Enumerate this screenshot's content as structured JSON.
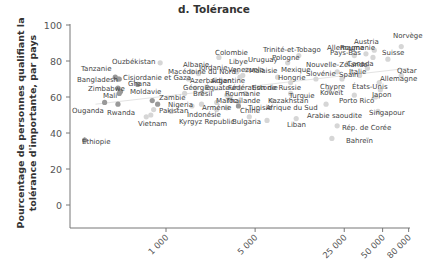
{
  "chart_data": {
    "type": "scatter",
    "title": "d. Tolérance",
    "xlabel": "",
    "ylabel": "Pourcentage de personnes qualifiant la tolérance d'importante, par pays",
    "xscale": "log",
    "xlim": [
      200,
      80000
    ],
    "ylim": [
      -13,
      100
    ],
    "x_ticks": [
      1000,
      5000,
      25000,
      50000,
      80000
    ],
    "x_tick_labels": [
      "1 000",
      "5 000",
      "25 000",
      "50 000",
      "80 000"
    ],
    "y_ticks": [
      0,
      20,
      40,
      60,
      80,
      100
    ],
    "y_tick_labels": [
      "0",
      "20",
      "40",
      "60",
      "80",
      "100"
    ],
    "grid": false,
    "legend": null,
    "trend_line": {
      "x": [
        280,
        80000
      ],
      "y": [
        56,
        76
      ]
    },
    "colors": {
      "low_income": "#999999",
      "high_income": "#d6d6d6",
      "text": "#444444"
    },
    "points": [
      {
        "label": "Tanzanie",
        "x": 400,
        "y": 71,
        "group": "low"
      },
      {
        "label": "Bangladesh",
        "x": 420,
        "y": 70,
        "group": "low"
      },
      {
        "label": "Ouzbékistan",
        "x": 900,
        "y": 79,
        "group": "high"
      },
      {
        "label": "Cisjordanie et Gaza",
        "x": 430,
        "y": 70,
        "group": "low"
      },
      {
        "label": "Ghana",
        "x": 600,
        "y": 67,
        "group": "low"
      },
      {
        "label": "Zimbabwe",
        "x": 420,
        "y": 65,
        "group": "low"
      },
      {
        "label": "Moldavie",
        "x": 440,
        "y": 63,
        "group": "low"
      },
      {
        "label": "Mali",
        "x": 430,
        "y": 62,
        "group": "low"
      },
      {
        "label": "Ouganda",
        "x": 330,
        "y": 57,
        "group": "low"
      },
      {
        "label": "Rwanda",
        "x": 420,
        "y": 56,
        "group": "low"
      },
      {
        "label": "Zambie",
        "x": 780,
        "y": 58,
        "group": "low"
      },
      {
        "label": "Nigeria",
        "x": 860,
        "y": 56,
        "group": "low"
      },
      {
        "label": "Pakistan",
        "x": 800,
        "y": 53,
        "group": "high"
      },
      {
        "label": "Vietnam",
        "x": 760,
        "y": 50,
        "group": "high"
      },
      {
        "label": "Indonésie",
        "x": 1100,
        "y": 52,
        "group": "high"
      },
      {
        "label": "Éthiopie",
        "x": 230,
        "y": 36,
        "group": "low"
      },
      {
        "label": "Albanie",
        "x": 1600,
        "y": 74,
        "group": "high"
      },
      {
        "label": "Macédoine du Nord",
        "x": 1500,
        "y": 70,
        "group": "high"
      },
      {
        "label": "Jordanie",
        "x": 1800,
        "y": 73,
        "group": "high"
      },
      {
        "label": "Azerbaïdjan",
        "x": 1700,
        "y": 65,
        "group": "high"
      },
      {
        "label": "Géorgie",
        "x": 1400,
        "y": 62,
        "group": "high"
      },
      {
        "label": "Équateur",
        "x": 1900,
        "y": 62,
        "group": "high"
      },
      {
        "label": "Arménie",
        "x": 1600,
        "y": 55,
        "group": "high"
      },
      {
        "label": "Kyrgyz Republic",
        "x": 700,
        "y": 49,
        "group": "high"
      },
      {
        "label": "Colombie",
        "x": 2600,
        "y": 82,
        "group": "high"
      },
      {
        "label": "Libye",
        "x": 3600,
        "y": 74,
        "group": "high"
      },
      {
        "label": "Uruguay",
        "x": 4300,
        "y": 75,
        "group": "high"
      },
      {
        "label": "Malaisie",
        "x": 4000,
        "y": 72,
        "group": "high"
      },
      {
        "label": "Venezuela",
        "x": 3800,
        "y": 71,
        "group": "high"
      },
      {
        "label": "Argentine",
        "x": 3800,
        "y": 65,
        "group": "high"
      },
      {
        "label": "Fédération de Russie",
        "x": 4200,
        "y": 62,
        "group": "high"
      },
      {
        "label": "Roumanie",
        "x": 3200,
        "y": 60,
        "group": "high"
      },
      {
        "label": "Brésil",
        "x": 3000,
        "y": 61,
        "group": "high"
      },
      {
        "label": "Thaïlande",
        "x": 2500,
        "y": 57,
        "group": "high"
      },
      {
        "label": "Kazakhstan",
        "x": 3700,
        "y": 57,
        "group": "high"
      },
      {
        "label": "Maroc",
        "x": 1900,
        "y": 56,
        "group": "high"
      },
      {
        "label": "Tunisie",
        "x": 3000,
        "y": 54,
        "group": "high"
      },
      {
        "label": "Chine",
        "x": 2500,
        "y": 53,
        "group": "high"
      },
      {
        "label": "Afrique du Sud",
        "x": 3700,
        "y": 55,
        "group": "low"
      },
      {
        "label": "Bulgaria",
        "x": 4500,
        "y": 49,
        "group": "high"
      },
      {
        "label": "Trinité-et-Tobago",
        "x": 11000,
        "y": 83,
        "group": "high"
      },
      {
        "label": "Pologne",
        "x": 9000,
        "y": 79,
        "group": "high"
      },
      {
        "label": "Mexique",
        "x": 7500,
        "y": 71,
        "group": "high"
      },
      {
        "label": "Hongrie",
        "x": 9500,
        "y": 68,
        "group": "high"
      },
      {
        "label": "Estonie",
        "x": 9500,
        "y": 62,
        "group": "high"
      },
      {
        "label": "Turquie",
        "x": 6800,
        "y": 58,
        "group": "high"
      },
      {
        "label": "Liban",
        "x": 6200,
        "y": 47,
        "group": "high"
      },
      {
        "label": "Nouvelle-Zélande",
        "x": 22000,
        "y": 74,
        "group": "high"
      },
      {
        "label": "Slovénie",
        "x": 15000,
        "y": 70,
        "group": "high"
      },
      {
        "label": "Spain",
        "x": 24000,
        "y": 70,
        "group": "high"
      },
      {
        "label": "Chypre",
        "x": 19000,
        "y": 64,
        "group": "high"
      },
      {
        "label": "Koweït",
        "x": 30000,
        "y": 61,
        "group": "high"
      },
      {
        "label": "Porto Rico",
        "x": 18000,
        "y": 56,
        "group": "high"
      },
      {
        "label": "Arabie saoudite",
        "x": 10500,
        "y": 48,
        "group": "high"
      },
      {
        "label": "Rép. de Corée",
        "x": 22000,
        "y": 44,
        "group": "high"
      },
      {
        "label": "Bahreïn",
        "x": 20000,
        "y": 37,
        "group": "high"
      },
      {
        "label": "Allemagne",
        "x": 37000,
        "y": 84,
        "group": "high"
      },
      {
        "label": "Roumanie",
        "x": 30000,
        "y": 83,
        "group": "high"
      },
      {
        "label": "Pays-Bas",
        "x": 42000,
        "y": 82,
        "group": "high"
      },
      {
        "label": "Austria",
        "x": 43000,
        "y": 86,
        "group": "high"
      },
      {
        "label": "Suisse",
        "x": 55000,
        "y": 81,
        "group": "high"
      },
      {
        "label": "Norvège",
        "x": 70000,
        "y": 88,
        "group": "high"
      },
      {
        "label": "Canada",
        "x": 38000,
        "y": 76,
        "group": "high"
      },
      {
        "label": "Italie",
        "x": 33000,
        "y": 72,
        "group": "high"
      },
      {
        "label": "Qatar",
        "x": 70000,
        "y": 72,
        "group": "high"
      },
      {
        "label": "Allemagne",
        "x": 47000,
        "y": 68,
        "group": "high"
      },
      {
        "label": "États-Unis",
        "x": 48000,
        "y": 64,
        "group": "high"
      },
      {
        "label": "Japon",
        "x": 44000,
        "y": 60,
        "group": "high"
      },
      {
        "label": "Singapour",
        "x": 46000,
        "y": 52,
        "group": "high"
      }
    ],
    "labels_placed": [
      {
        "text": "Tanzanie",
        "x": 81,
        "y": 71
      },
      {
        "text": "Bangladesh",
        "x": 77,
        "y": 82
      },
      {
        "text": "Ouzbékistan",
        "x": 112,
        "y": 64
      },
      {
        "text": "Cisjordanie et Gaza",
        "x": 123,
        "y": 80
      },
      {
        "text": "Ghana",
        "x": 128,
        "y": 86
      },
      {
        "text": "Zimbabwe",
        "x": 88,
        "y": 91
      },
      {
        "text": "Moldavie",
        "x": 130,
        "y": 94
      },
      {
        "text": "Mali",
        "x": 103,
        "y": 98
      },
      {
        "text": "Ouganda",
        "x": 72,
        "y": 113
      },
      {
        "text": "Rwanda",
        "x": 107,
        "y": 115
      },
      {
        "text": "Zambie",
        "x": 159,
        "y": 100
      },
      {
        "text": "Nigeria",
        "x": 168,
        "y": 107
      },
      {
        "text": "Pakistan",
        "x": 159,
        "y": 113
      },
      {
        "text": "Vietnam",
        "x": 138,
        "y": 126
      },
      {
        "text": "Indonésie",
        "x": 187,
        "y": 117
      },
      {
        "text": "Éthiopie",
        "x": 82,
        "y": 144
      },
      {
        "text": "Albanie",
        "x": 183,
        "y": 67
      },
      {
        "text": "Jordanie",
        "x": 199,
        "y": 70
      },
      {
        "text": "Macédoine du Nord",
        "x": 168,
        "y": 74
      },
      {
        "text": "Azerbaïdjan",
        "x": 190,
        "y": 83
      },
      {
        "text": "Argentine",
        "x": 211,
        "y": 83
      },
      {
        "text": "Géorgie",
        "x": 183,
        "y": 90
      },
      {
        "text": "Équateur",
        "x": 205,
        "y": 90
      },
      {
        "text": "Fédération de Russie",
        "x": 228,
        "y": 90
      },
      {
        "text": "Roumanie",
        "x": 225,
        "y": 96
      },
      {
        "text": "Brésil",
        "x": 193,
        "y": 96
      },
      {
        "text": "Thaïlande",
        "x": 226,
        "y": 103
      },
      {
        "text": "Kazakhstan",
        "x": 268,
        "y": 103
      },
      {
        "text": "Maroc",
        "x": 216,
        "y": 103
      },
      {
        "text": "Arménie",
        "x": 202,
        "y": 110
      },
      {
        "text": "Tunisie",
        "x": 248,
        "y": 110
      },
      {
        "text": "Chine",
        "x": 240,
        "y": 113
      },
      {
        "text": "Afrique du Sud",
        "x": 266,
        "y": 110
      },
      {
        "text": "Kyrgyz Republic",
        "x": 179,
        "y": 124
      },
      {
        "text": "Bulgaria",
        "x": 232,
        "y": 124
      },
      {
        "text": "Colombie",
        "x": 215,
        "y": 55
      },
      {
        "text": "Libye",
        "x": 229,
        "y": 64
      },
      {
        "text": "Uruguay",
        "x": 248,
        "y": 62
      },
      {
        "text": "Venezuela",
        "x": 228,
        "y": 72
      },
      {
        "text": "Malaisie",
        "x": 249,
        "y": 73
      },
      {
        "text": "Trinité-et-Tobago",
        "x": 263,
        "y": 52
      },
      {
        "text": "Pologne",
        "x": 272,
        "y": 60
      },
      {
        "text": "Mexique",
        "x": 281,
        "y": 72
      },
      {
        "text": "Hongrie",
        "x": 278,
        "y": 80
      },
      {
        "text": "Estonie",
        "x": 252,
        "y": 90
      },
      {
        "text": "Turquie",
        "x": 289,
        "y": 98
      },
      {
        "text": "Liban",
        "x": 287,
        "y": 127
      },
      {
        "text": "Nouvelle-Zélande",
        "x": 306,
        "y": 67
      },
      {
        "text": "Slovénie",
        "x": 306,
        "y": 76
      },
      {
        "text": "Spain",
        "x": 339,
        "y": 77
      },
      {
        "text": "Chypre",
        "x": 320,
        "y": 89
      },
      {
        "text": "Koweït",
        "x": 320,
        "y": 95
      },
      {
        "text": "Porto Rico",
        "x": 339,
        "y": 103
      },
      {
        "text": "Arabie saoudite",
        "x": 307,
        "y": 118
      },
      {
        "text": "Rép. de Corée",
        "x": 342,
        "y": 130
      },
      {
        "text": "Bahreïn",
        "x": 346,
        "y": 143
      },
      {
        "text": "Austria",
        "x": 354,
        "y": 44
      },
      {
        "text": "Allemagne",
        "x": 327,
        "y": 50
      },
      {
        "text": "Roumanie",
        "x": 340,
        "y": 50
      },
      {
        "text": "Pays-Bas",
        "x": 330,
        "y": 55
      },
      {
        "text": "Norvège",
        "x": 393,
        "y": 38
      },
      {
        "text": "Suisse",
        "x": 382,
        "y": 55
      },
      {
        "text": "Canada",
        "x": 347,
        "y": 66
      },
      {
        "text": "Italie",
        "x": 349,
        "y": 74
      },
      {
        "text": "Qatar",
        "x": 397,
        "y": 73
      },
      {
        "text": "Allemagne",
        "x": 380,
        "y": 81
      },
      {
        "text": "États-Unis",
        "x": 352,
        "y": 89
      },
      {
        "text": "Japon",
        "x": 372,
        "y": 97
      },
      {
        "text": "Singapour",
        "x": 369,
        "y": 115
      }
    ]
  }
}
